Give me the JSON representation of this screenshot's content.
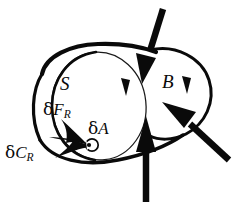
{
  "figure": {
    "background_color": "#ffffff",
    "ink_color": "#0a0a0a",
    "width": 241,
    "height": 203
  },
  "labels": {
    "cut_surface": "S",
    "body": "B",
    "resultant_force": {
      "greek": "δ",
      "symbol": "F",
      "subscript": "R"
    },
    "resultant_couple": {
      "greek": "δ",
      "symbol": "C",
      "subscript": "R"
    },
    "area_element": {
      "greek": "δ",
      "symbol": "A"
    }
  },
  "shapes": {
    "body_outline": "thick closed blob outline of body B",
    "cut_surface_ellipse": "thin ellipse representing cut plane S",
    "moment_circle": "small circular arrow at point of application"
  },
  "arrows": [
    {
      "name": "traction-arrow-top",
      "direction": "down-left",
      "style": "solid-filled"
    },
    {
      "name": "traction-arrow-bottom",
      "direction": "up",
      "style": "solid-filled"
    },
    {
      "name": "traction-arrow-right",
      "direction": "up-left",
      "style": "solid-filled"
    },
    {
      "name": "resultant-force-arrow",
      "direction": "down-right",
      "style": "solid-filled curved spearhead"
    },
    {
      "name": "resultant-couple-arrow",
      "direction": "right",
      "style": "solid-filled curved spearhead"
    }
  ],
  "arc_marks": [
    {
      "name": "surface-arc-mark-left",
      "description": "small arrowhead tick on S boundary arc"
    },
    {
      "name": "surface-arc-mark-right",
      "description": "small arrowhead tick on B boundary arc"
    }
  ]
}
